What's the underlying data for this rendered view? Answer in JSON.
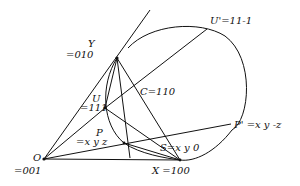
{
  "diagram": {
    "type": "geometric construction",
    "colors": {
      "stroke": "#111111",
      "background": "#ffffff"
    },
    "points": {
      "O": {
        "name": "O",
        "value": "=001",
        "x": 44,
        "y": 159
      },
      "X": {
        "name": "X",
        "value": "X =100",
        "x": 180,
        "y": 160
      },
      "Y": {
        "name": "Y",
        "value": "=010",
        "x": 117,
        "y": 58
      },
      "U": {
        "name": "U",
        "value": "=111",
        "x": 105,
        "y": 108
      },
      "P": {
        "name": "P",
        "value": "=x y z",
        "x": 124,
        "y": 143
      },
      "S": {
        "name": "S",
        "value": "S=x y 0",
        "x": 163,
        "y": 141
      },
      "C": {
        "name": "C",
        "value": "C=110",
        "x": 134,
        "y": 91
      },
      "Up": {
        "name": "U'",
        "value": "U'=11-1",
        "x": 207,
        "y": 29
      },
      "Pp": {
        "name": "P'",
        "value": "P' =x y -z",
        "x": 231,
        "y": 124
      }
    },
    "labels": {
      "Y_name": "Y",
      "Y_value": "=010",
      "O_name": "O",
      "O_value": "=001",
      "X_label": "X =100",
      "U_name": "U",
      "U_value": "=111",
      "P_name": "P",
      "P_value": "=x y z",
      "S_label": "S=x y 0",
      "C_label": "C=110",
      "Up_label": "U'=11-1",
      "Pp_label": "P' =x y -z"
    }
  }
}
